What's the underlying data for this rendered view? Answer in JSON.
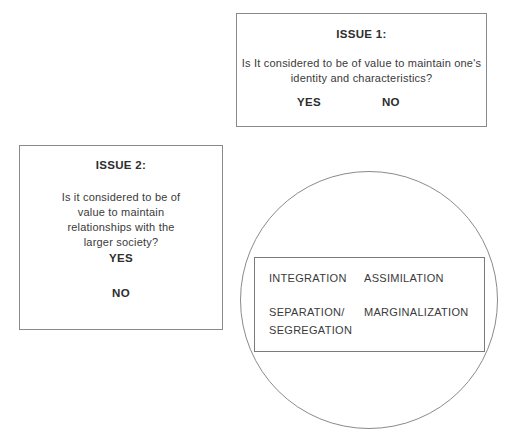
{
  "issue1": {
    "title": "ISSUE 1:",
    "question_line1": "Is It considered to be of value to maintain one's",
    "question_line2": "identity and characteristics?",
    "yes": "YES",
    "no": "NO"
  },
  "issue2": {
    "title": "ISSUE 2:",
    "question_line1": "Is it considered to be of",
    "question_line2": "value to maintain",
    "question_line3": "relationships with the",
    "question_line4": "larger society?",
    "yes": "YES",
    "no": "NO"
  },
  "strategies": {
    "integration": "INTEGRATION",
    "assimilation": "ASSIMILATION",
    "separation_line1": "SEPARATION/",
    "separation_line2": "SEGREGATION",
    "marginalization": "MARGINALIZATION"
  }
}
